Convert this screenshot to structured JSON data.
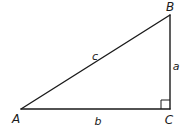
{
  "diagram": {
    "type": "right-triangle",
    "stroke_color": "#1a1a1a",
    "background": "#ffffff",
    "vertices": [
      {
        "label": "A",
        "x": 21,
        "y": 109,
        "label_x": 16,
        "label_y": 119
      },
      {
        "label": "B",
        "x": 170,
        "y": 15,
        "label_x": 170,
        "label_y": 7
      },
      {
        "label": "C",
        "x": 170,
        "y": 109,
        "label_x": 169,
        "label_y": 120
      }
    ],
    "sides": [
      {
        "label": "c",
        "from": "A",
        "to": "B",
        "label_x": 95,
        "label_y": 56
      },
      {
        "label": "a",
        "from": "B",
        "to": "C",
        "label_x": 176,
        "label_y": 66
      },
      {
        "label": "b",
        "from": "A",
        "to": "C",
        "label_x": 98,
        "label_y": 121
      }
    ],
    "right_angle": {
      "at": "C",
      "size": 9
    }
  }
}
